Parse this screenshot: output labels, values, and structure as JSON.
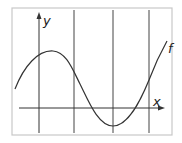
{
  "diagram": {
    "type": "function-graph",
    "axis_labels": {
      "x": "x",
      "y": "y"
    },
    "function_label": "f",
    "vertical_gridlines": 4,
    "colors": {
      "frame": "#c8c8c8",
      "line": "#333333",
      "background": "#ffffff"
    }
  }
}
